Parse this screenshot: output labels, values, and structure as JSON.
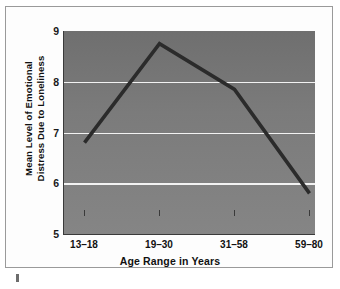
{
  "chart_data": {
    "type": "line",
    "title": "",
    "subtitle": "",
    "xlabel": "Age Range in Years",
    "ylabel": "Mean Level of Emotional Distress Due to Loneliness",
    "ylabel_line1": "Mean Level of Emotional",
    "ylabel_line2": "Distress Due to Loneliness",
    "categories": [
      "13–18",
      "19–30",
      "31–58",
      "59–80"
    ],
    "values": [
      6.8,
      8.75,
      7.85,
      5.8
    ],
    "series": [
      {
        "name": "Mean Level of Emotional Distress Due to Loneliness",
        "values": [
          6.8,
          8.75,
          7.85,
          5.8
        ]
      }
    ],
    "ylim": [
      5,
      9
    ],
    "y_ticks": [
      9,
      8,
      7,
      6,
      5
    ],
    "y_tick_labels": [
      "9",
      "8",
      "7",
      "6",
      "5"
    ],
    "x_tick_labels": [
      "13–18",
      "19–30",
      "31–58",
      "59–80"
    ],
    "gridlines": {
      "horizontal": [
        8,
        7,
        6
      ],
      "vertical": []
    },
    "grid": true,
    "legend": false,
    "legend_position": "none",
    "annotations": [],
    "colors": {
      "line": "#2b2b2b",
      "plot_background_top": "#6f6f6f",
      "plot_background_bottom": "#858585",
      "gridline": "#f2f2f2",
      "axis": "#3a3a3a",
      "text": "#111111",
      "card_background": "#fdfdfd",
      "card_border": "#9a9a9a",
      "footer_mark": "#6d6d6d"
    }
  },
  "figure": {
    "footer_mark_label": ""
  }
}
